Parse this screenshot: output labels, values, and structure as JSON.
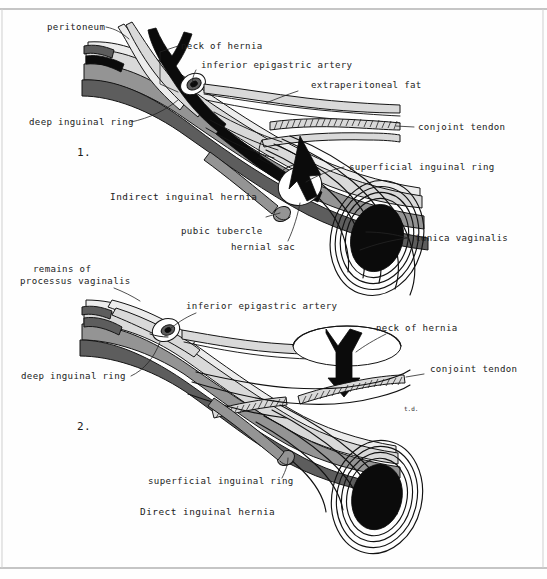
{
  "figure": {
    "signature": "t.d.",
    "background_color": "#fefefe",
    "ink_color": "#111111",
    "border_color": "#8c8c8c"
  },
  "panel1": {
    "number": "1.",
    "caption": "Indirect inguinal hernia",
    "labels": {
      "peritoneum": "peritoneum",
      "neck_of_hernia": "neck of hernia",
      "inferior_epigastric_artery": "inferior epigastric artery",
      "extraperitoneal_fat": "extraperitoneal fat",
      "conjoint_tendon": "conjoint tendon",
      "deep_inguinal_ring": "deep inguinal ring",
      "superficial_inguinal_ring": "superficial inguinal ring",
      "pubic_tubercle": "pubic tubercle",
      "hernial_sac": "hernial sac",
      "tunica_vaginalis": "tunica vaginalis"
    }
  },
  "panel2": {
    "number": "2.",
    "caption": "Direct inguinal hernia",
    "labels": {
      "remains_of_processus_vaginalis_line1": "remains of",
      "remains_of_processus_vaginalis_line2": "processus vaginalis",
      "inferior_epigastric_artery": "inferior epigastric artery",
      "neck_of_hernia": "neck of hernia",
      "conjoint_tendon": "conjoint tendon",
      "deep_inguinal_ring": "deep inguinal ring",
      "superficial_inguinal_ring": "superficial inguinal ring"
    }
  },
  "legend_colors": {
    "peritoneum_layer": "#5d5d5d",
    "muscle_layer": "#949494",
    "fat_layer": "#d9d9d9",
    "vessel_black": "#0b0b0b",
    "testis_black": "#0b0b0b",
    "paper": "#fefefe"
  }
}
